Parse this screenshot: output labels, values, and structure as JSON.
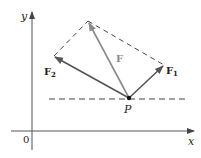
{
  "figure": {
    "labels": {
      "y_axis": "y",
      "x_axis": "x",
      "origin": "0",
      "point": "P",
      "resultant": "F",
      "force1": "F",
      "force1_sub": "1",
      "force2": "F",
      "force2_sub": "2"
    },
    "colors": {
      "axis": "#555555",
      "dashed": "#444444",
      "resultant": "#8a8a8a",
      "components": "#555555",
      "point": "#111111"
    },
    "geometry": {
      "P": [
        129,
        98
      ],
      "F_tip": [
        88,
        21
      ],
      "F1_tip": [
        164,
        65
      ],
      "F2_tip": [
        54,
        56
      ],
      "origin": [
        32,
        131
      ]
    }
  }
}
